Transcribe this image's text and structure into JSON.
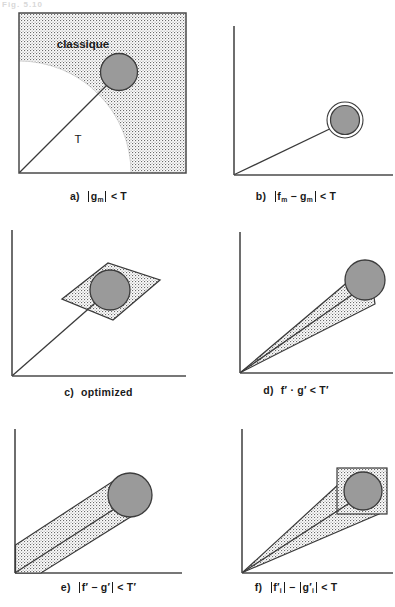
{
  "figure": {
    "header_fragment": "Fig. 5.10",
    "width": 395,
    "height": 607,
    "background_color": "#ffffff",
    "line_color": "#3a3a3a",
    "circle_fill": "#9a9a9a",
    "stipple_color": "#555555"
  },
  "panels": [
    {
      "id": "a",
      "label": "a)",
      "name": "panel-a-classique",
      "shape": "square-with-quarter-circle",
      "region_label": "classique",
      "threshold_label": "T",
      "caption_parts": {
        "expr_left": "g",
        "expr_left_sub": "m",
        "relation": "<",
        "expr_right": "T"
      },
      "caption_text": "a)  |g m| < T"
    },
    {
      "id": "b",
      "label": "b)",
      "name": "panel-b-ring",
      "shape": "axes-with-ringed-circle",
      "caption_parts": {
        "term1": "f",
        "term1_sub": "m",
        "operator": "−",
        "term2": "g",
        "term2_sub": "m",
        "relation": "<",
        "expr_right": "T"
      },
      "caption_text": "b)  |f m − g m| < T"
    },
    {
      "id": "c",
      "label": "c)",
      "name": "panel-c-optimized",
      "shape": "axes-with-parallelogram",
      "caption_text": "c)  optimized",
      "caption_word": "optimized"
    },
    {
      "id": "d",
      "label": "d)",
      "name": "panel-d-wedge",
      "shape": "axes-with-narrow-wedge",
      "caption_parts": {
        "term1": "f′",
        "operator": "·",
        "term2": "g′",
        "relation": "<",
        "expr_right": "T′"
      },
      "caption_text": "d)  f′ · g′ < T′"
    },
    {
      "id": "e",
      "label": "e)",
      "name": "panel-e-band",
      "shape": "axes-with-diagonal-band",
      "caption_parts": {
        "term1": "f′",
        "operator": "−",
        "term2": "g′",
        "relation": "<",
        "expr_right": "T′"
      },
      "caption_text": "e)  |f′ − g′| < T′"
    },
    {
      "id": "f",
      "label": "f)",
      "name": "panel-f-wedge-box",
      "shape": "axes-with-wedge-and-box",
      "caption_parts": {
        "term1": "f′",
        "term1_sub": "i",
        "operator": "−",
        "term2": "g′",
        "term2_sub": "i",
        "relation": "<",
        "expr_right": "T"
      },
      "caption_text": "f)  |f′i| − |g′i| < T"
    }
  ]
}
